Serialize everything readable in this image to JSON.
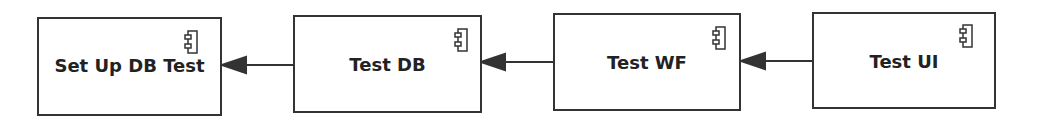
{
  "diagram": {
    "type": "uml-component-dependency",
    "components": [
      {
        "id": "setup",
        "label": "Set Up DB Test",
        "icon": "component-icon"
      },
      {
        "id": "testdb",
        "label": "Test DB",
        "icon": "component-icon"
      },
      {
        "id": "testwf",
        "label": "Test WF",
        "icon": "component-icon"
      },
      {
        "id": "testui",
        "label": "Test UI",
        "icon": "component-icon"
      }
    ],
    "dependencies": [
      {
        "from": "Test DB",
        "to": "Set Up DB Test"
      },
      {
        "from": "Test WF",
        "to": "Test DB"
      },
      {
        "from": "Test UI",
        "to": "Test WF"
      }
    ],
    "colors": {
      "stroke": "#333333",
      "fill": "#ffffff",
      "text": "#222222"
    }
  }
}
